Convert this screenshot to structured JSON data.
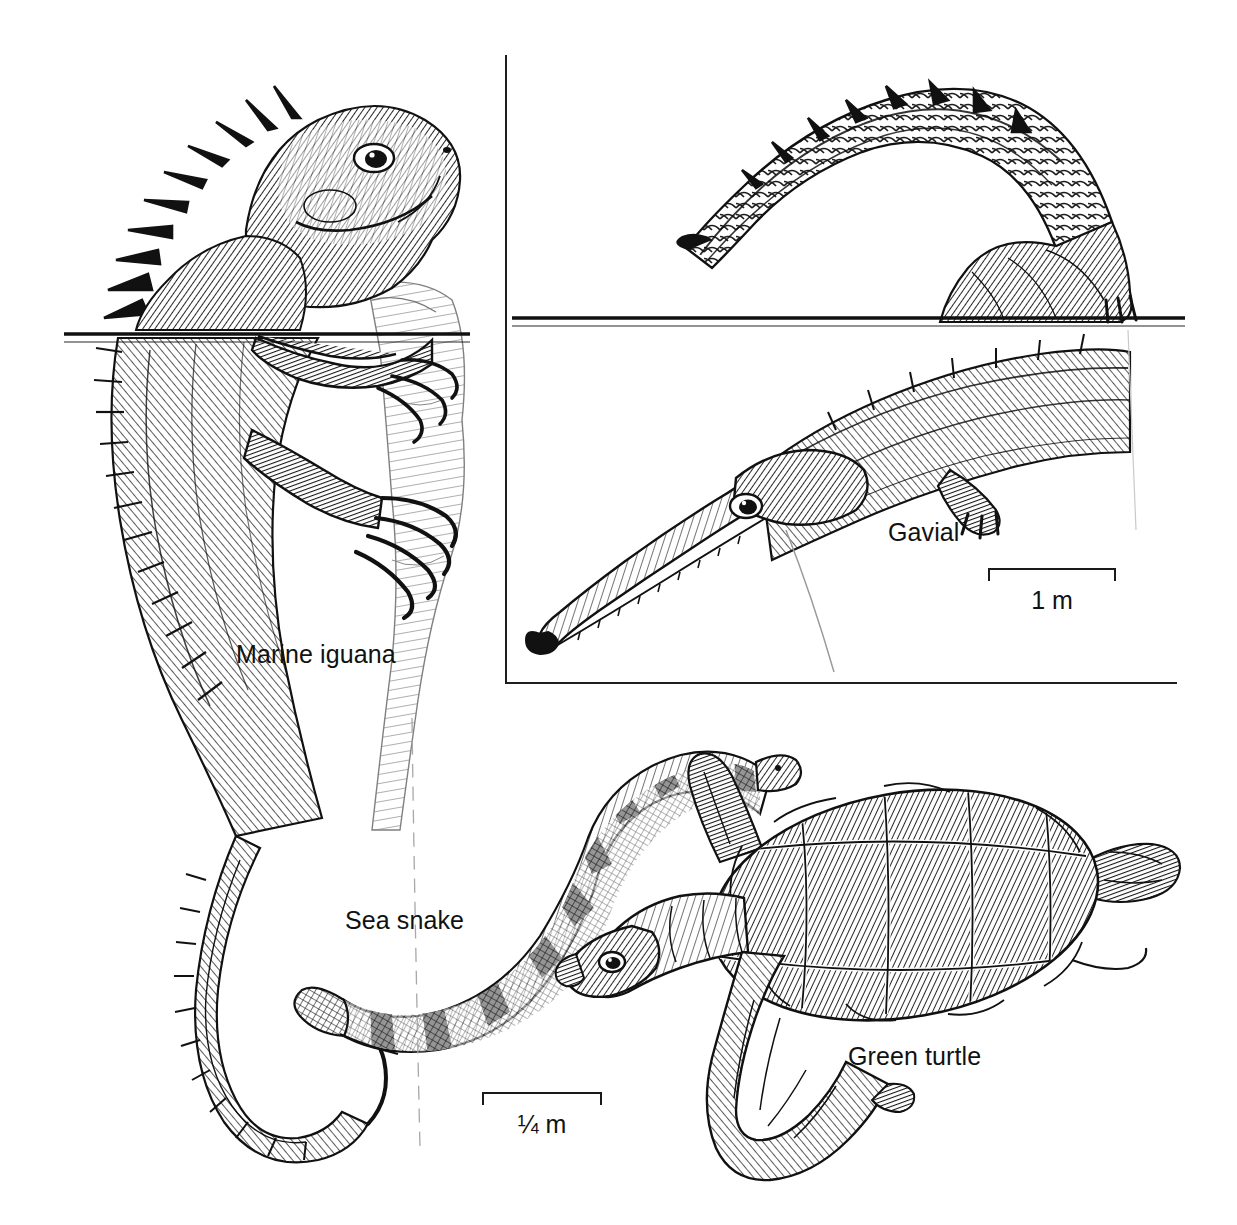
{
  "figure": {
    "kind": "scientific-illustration-plate",
    "background_color": "#ffffff",
    "ink_color": "#111111",
    "width": 1237,
    "height": 1225
  },
  "labels": {
    "marine_iguana": "Marine iguana",
    "gavial": "Gavial",
    "sea_snake": "Sea snake",
    "green_turtle": "Green turtle"
  },
  "scale_bars": [
    {
      "id": "gavial-scale",
      "caption": "1 m"
    },
    {
      "id": "turtle-scale",
      "caption": "¼ m"
    }
  ],
  "organisms": [
    {
      "name": "Marine iguana",
      "panel": "left",
      "posture": "clinging to rock, head above water, body and long tail submerged",
      "features": [
        "dorsal spine crest",
        "blunt snout",
        "long clawed toes",
        "laterally flattened tail"
      ]
    },
    {
      "name": "Gavial",
      "panel": "upper-right",
      "posture": "arched tail above waterline, long narrow snout submerged",
      "features": [
        "elongate narrow snout",
        "bulbous snout tip",
        "armored keeled scutes",
        "webbed hind foot"
      ]
    },
    {
      "name": "Sea snake",
      "panel": "lower-center",
      "posture": "undulating S-curve, swimming",
      "features": [
        "dark transverse bands",
        "paddle-shaped flattened tail"
      ]
    },
    {
      "name": "Green turtle",
      "panel": "lower-right",
      "posture": "swimming, front flipper extended",
      "features": [
        "hexagonal carapace scutes",
        "paddle-like flippers",
        "hooked beak"
      ]
    }
  ]
}
